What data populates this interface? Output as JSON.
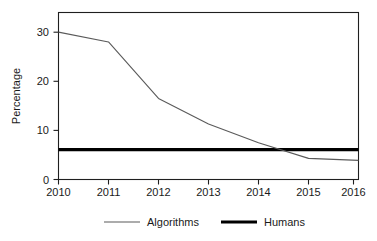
{
  "figure": {
    "background_color": "#ffffff",
    "frame_color": "#1f1f1f"
  },
  "chart_data": {
    "type": "line",
    "title": "",
    "subtitle": "",
    "xlabel": "",
    "ylabel": "Percentage",
    "x": [
      2010,
      2011,
      2012,
      2013,
      2014,
      2015,
      2016
    ],
    "xtick_labels": [
      "2010",
      "2011",
      "2012",
      "2013",
      "2014",
      "2015",
      "2016"
    ],
    "ytick_labels": [
      "0",
      "10",
      "20",
      "30"
    ],
    "yticks": [
      0,
      10,
      20,
      30
    ],
    "xlim": [
      2010,
      2016
    ],
    "ylim": [
      0,
      34
    ],
    "grid": false,
    "legend_position": "bottom",
    "annotations": [],
    "series": [
      {
        "name": "Algorithms",
        "color": "#5a5a5a",
        "line_width": 1.1,
        "values": [
          30.0,
          28.0,
          16.5,
          11.3,
          7.5,
          4.3,
          3.9
        ]
      },
      {
        "name": "Humans",
        "color": "#000000",
        "line_width": 3.2,
        "values": [
          6.1,
          6.1,
          6.1,
          6.1,
          6.1,
          6.1,
          6.1
        ]
      }
    ]
  },
  "legend": {
    "entries": [
      {
        "label": "Algorithms",
        "color": "#5a5a5a"
      },
      {
        "label": "Humans",
        "color": "#000000"
      }
    ]
  }
}
